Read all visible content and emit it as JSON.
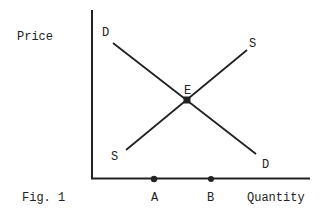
{
  "diagram": {
    "type": "supply-demand",
    "figure_label": "Fig. 1",
    "axes": {
      "y_label": "Price",
      "x_label": "Quantity"
    },
    "curves": {
      "demand": {
        "label_start": "D",
        "label_end": "D"
      },
      "supply": {
        "label_start": "S",
        "label_end": "S"
      }
    },
    "equilibrium": {
      "label": "E"
    },
    "x_points": [
      {
        "label": "A"
      },
      {
        "label": "B"
      }
    ],
    "colors": {
      "ink": "#222222",
      "background": "#ffffff"
    }
  }
}
